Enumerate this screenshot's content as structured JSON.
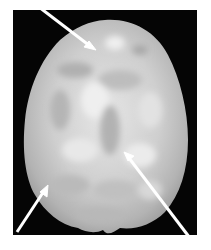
{
  "figure": {
    "background_color": "#050505",
    "surface_color": "#c8c8c8",
    "arrow_color": "#ffffff",
    "arrows": [
      {
        "label": "top-left arrow",
        "from": [
          35,
          4
        ],
        "to": [
          96,
          50
        ]
      },
      {
        "label": "bottom-left arrow",
        "from": [
          17,
          232
        ],
        "to": [
          48,
          185
        ]
      },
      {
        "label": "bottom-right arrow",
        "from": [
          196,
          246
        ],
        "to": [
          124,
          152
        ]
      }
    ]
  }
}
